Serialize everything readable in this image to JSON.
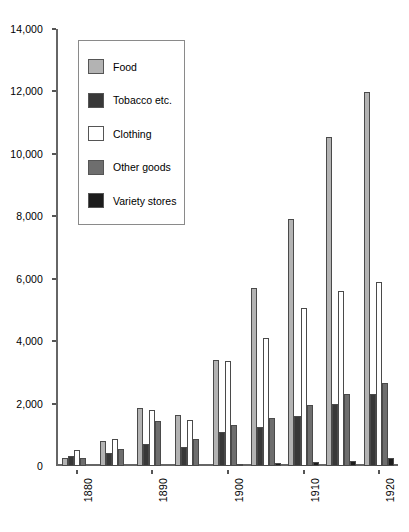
{
  "chart_data": {
    "type": "bar",
    "title": "",
    "subtitle": "",
    "xlabel": "",
    "ylabel": "",
    "ylim": [
      0,
      14000
    ],
    "ytick_step": 2000,
    "ytick_labels": [
      "0",
      "2,000",
      "4,000",
      "6,000",
      "8,000",
      "10,000",
      "12,000",
      "14,000"
    ],
    "ytick_values": [
      0,
      2000,
      4000,
      6000,
      8000,
      10000,
      12000,
      14000
    ],
    "grid": false,
    "legend_position": "upper-left-inside",
    "categories": [
      "1880",
      "1885",
      "1890",
      "1895",
      "1900",
      "1905",
      "1910",
      "1915",
      "1920"
    ],
    "xtick_labels": [
      "1880",
      "1890",
      "1900",
      "1910",
      "1920"
    ],
    "xtick_categories": [
      "1880",
      "1890",
      "1900",
      "1910",
      "1920"
    ],
    "series": [
      {
        "name": "Food",
        "color": "#b3b3b3",
        "values": [
          250,
          800,
          1850,
          1650,
          3400,
          5700,
          7900,
          10550,
          11980
        ]
      },
      {
        "name": "Tobacco etc.",
        "color": "#383838",
        "values": [
          330,
          430,
          700,
          600,
          1100,
          1250,
          1600,
          2000,
          2300
        ]
      },
      {
        "name": "Clothing",
        "color": "#ffffff",
        "values": [
          500,
          880,
          1800,
          1480,
          3350,
          4100,
          5050,
          5600,
          5900
        ]
      },
      {
        "name": "Other goods",
        "color": "#6e6e6e",
        "values": [
          260,
          560,
          1450,
          870,
          1300,
          1550,
          1950,
          2300,
          2650
        ]
      },
      {
        "name": "Variety stores",
        "color": "#1c1c1c",
        "values": [
          0,
          0,
          0,
          0,
          60,
          110,
          130,
          170,
          260
        ]
      }
    ]
  },
  "legend": {
    "items": [
      {
        "label": "Food"
      },
      {
        "label": "Tobacco etc."
      },
      {
        "label": "Clothing"
      },
      {
        "label": "Other goods"
      },
      {
        "label": "Variety stores"
      }
    ]
  }
}
